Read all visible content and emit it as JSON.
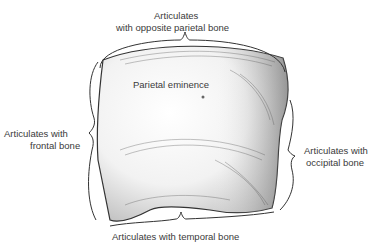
{
  "title": "Parietal bone",
  "labels": {
    "top_line1": "Articulates",
    "top_line2": "with opposite parietal bone",
    "eminence": "Parietal eminence",
    "left_line1": "Articulates with",
    "left_line2": "frontal bone",
    "right_line1": "Articulates with",
    "right_line2": "occipital bone",
    "bottom": "Articulates with temporal bone"
  },
  "colors": {
    "line": "#333333",
    "shade": "#9a9a9a",
    "text": "#3a3a3a"
  }
}
